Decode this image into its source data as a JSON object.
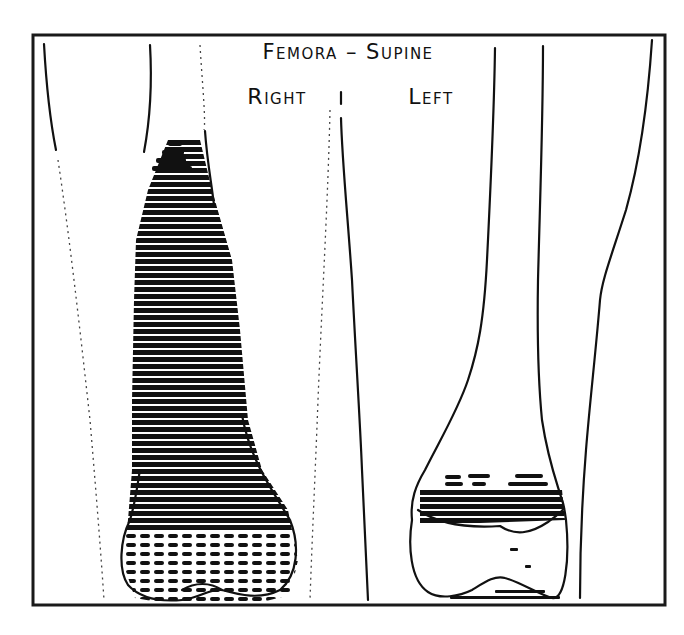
{
  "diagram": {
    "title": "Femora – Supine",
    "labels": {
      "right": "Right",
      "left": "Left"
    },
    "colors": {
      "ink": "#111111",
      "background": "#ffffff"
    },
    "panels": [
      {
        "side": "Right",
        "uptake": "diffuse intense uptake along shaft and distal femur"
      },
      {
        "side": "Left",
        "uptake": "focal band of uptake at distal metaphysis"
      }
    ]
  }
}
